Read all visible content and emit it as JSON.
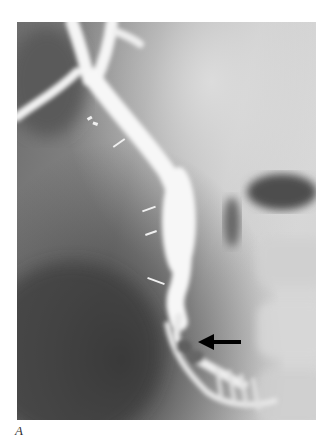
{
  "figure": {
    "type": "radiograph",
    "panel_label": "A",
    "annotations": [
      {
        "kind": "arrow",
        "direction": "left",
        "color": "#000000"
      }
    ]
  }
}
